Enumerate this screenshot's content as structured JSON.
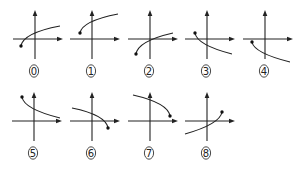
{
  "diagram": {
    "colors": {
      "ink": "#222222",
      "background": "#ffffff"
    },
    "figures": [
      {
        "label": "0",
        "ox": 35,
        "oy": 39,
        "dot": [
          21,
          46
        ],
        "end": [
          60,
          26
        ],
        "ctrl": [
          23,
          33
        ],
        "dot_at": "start"
      },
      {
        "label": "1",
        "ox": 92,
        "oy": 39,
        "dot": [
          80,
          33
        ],
        "end": [
          118,
          14
        ],
        "ctrl": [
          82,
          21
        ],
        "dot_at": "start"
      },
      {
        "label": "2",
        "ox": 150,
        "oy": 39,
        "dot": [
          136,
          54
        ],
        "end": [
          173,
          33
        ],
        "ctrl": [
          138,
          41
        ],
        "dot_at": "start"
      },
      {
        "label": "3",
        "ox": 207,
        "oy": 39,
        "dot": [
          195,
          33
        ],
        "end": [
          232,
          54
        ],
        "ctrl": [
          197,
          45
        ],
        "dot_at": "start"
      },
      {
        "label": "4",
        "ox": 265,
        "oy": 39,
        "dot": [
          252,
          42
        ],
        "end": [
          290,
          62
        ],
        "ctrl": [
          254,
          53
        ],
        "dot_at": "start"
      },
      {
        "label": "5",
        "ox": 34,
        "oy": 121,
        "dot": [
          22,
          97
        ],
        "end": [
          60,
          118
        ],
        "ctrl": [
          24,
          109
        ],
        "dot_at": "start"
      },
      {
        "label": "6",
        "ox": 92,
        "oy": 121,
        "dot": [
          108,
          128
        ],
        "end": [
          72,
          108
        ],
        "ctrl": [
          106,
          115
        ],
        "dot_at": "start"
      },
      {
        "label": "7",
        "ox": 150,
        "oy": 121,
        "dot": [
          170,
          116
        ],
        "end": [
          133,
          95
        ],
        "ctrl": [
          168,
          103
        ],
        "dot_at": "start"
      },
      {
        "label": "8",
        "ox": 207,
        "oy": 121,
        "dot": [
          222,
          112
        ],
        "end": [
          185,
          134
        ],
        "ctrl": [
          220,
          124
        ],
        "dot_at": "start"
      }
    ]
  }
}
